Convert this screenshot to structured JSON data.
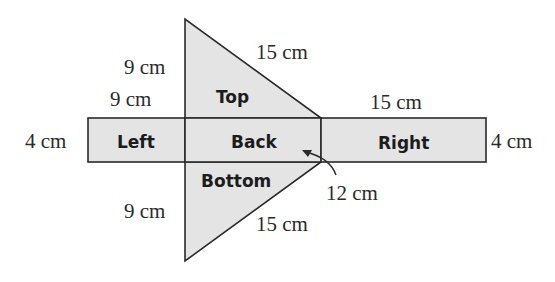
{
  "diagram": {
    "type": "net of triangular prism",
    "fill_color": "#e4e4e4",
    "stroke_color": "#2a2a2a",
    "faces": {
      "top": "Top",
      "left": "Left",
      "back": "Back",
      "right": "Right",
      "bottom": "Bottom"
    },
    "dimensions": {
      "top_leg_outer": "9 cm",
      "top_leg_inner": "9 cm",
      "top_hypotenuse": "15 cm",
      "right_length": "15 cm",
      "left_height": "4 cm",
      "right_height": "4 cm",
      "back_length": "12 cm",
      "bottom_leg": "9 cm",
      "bottom_hypotenuse": "15 cm"
    }
  }
}
